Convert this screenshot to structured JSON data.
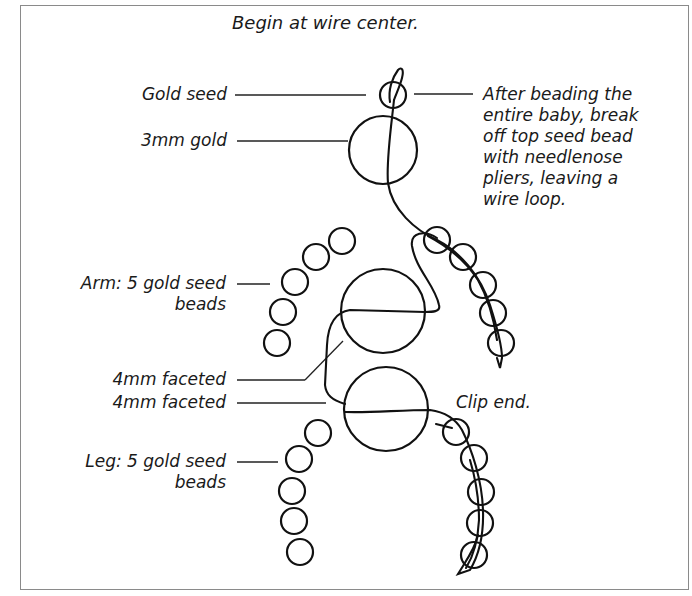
{
  "title": "Begin at wire center.",
  "colors": {
    "stroke": "#111111",
    "frame": "#8a8a8a",
    "leader": "#222222",
    "text": "#1a1a1a"
  },
  "labels": {
    "gold_seed": "Gold seed",
    "gold_3mm": "3mm gold",
    "arm_line1": "Arm: 5 gold seed",
    "arm_line2": "beads",
    "faceted_1": "4mm faceted",
    "faceted_2": "4mm faceted",
    "leg_line1": "Leg: 5 gold seed",
    "leg_line2": "beads",
    "clip_end": "Clip end.",
    "note_lines": [
      "After beading the",
      "entire baby, break",
      "off top seed bead",
      "with needlenose",
      "pliers, leaving a",
      "wire loop."
    ]
  },
  "beads": {
    "top_seed": {
      "cx": 393,
      "cy": 95,
      "r": 13
    },
    "head": {
      "cx": 383,
      "cy": 150,
      "r": 34
    },
    "body_upper": {
      "cx": 383,
      "cy": 311,
      "r": 42
    },
    "body_lower": {
      "cx": 386,
      "cy": 409,
      "r": 42
    },
    "left_arm": [
      {
        "cx": 342,
        "cy": 241,
        "r": 13
      },
      {
        "cx": 316,
        "cy": 257,
        "r": 13
      },
      {
        "cx": 295,
        "cy": 282,
        "r": 13
      },
      {
        "cx": 283,
        "cy": 312,
        "r": 13
      },
      {
        "cx": 277,
        "cy": 343,
        "r": 13
      }
    ],
    "right_arm": [
      {
        "cx": 437,
        "cy": 240,
        "r": 13
      },
      {
        "cx": 463,
        "cy": 257,
        "r": 13
      },
      {
        "cx": 483,
        "cy": 285,
        "r": 13
      },
      {
        "cx": 493,
        "cy": 313,
        "r": 13
      },
      {
        "cx": 501,
        "cy": 343,
        "r": 13
      }
    ],
    "left_leg": [
      {
        "cx": 318,
        "cy": 433,
        "r": 13
      },
      {
        "cx": 299,
        "cy": 459,
        "r": 13
      },
      {
        "cx": 292,
        "cy": 491,
        "r": 13
      },
      {
        "cx": 294,
        "cy": 521,
        "r": 13
      },
      {
        "cx": 300,
        "cy": 552,
        "r": 13
      }
    ],
    "right_leg": [
      {
        "cx": 456,
        "cy": 432,
        "r": 13
      },
      {
        "cx": 474,
        "cy": 458,
        "r": 13
      },
      {
        "cx": 481,
        "cy": 492,
        "r": 13
      },
      {
        "cx": 480,
        "cy": 523,
        "r": 13
      },
      {
        "cx": 474,
        "cy": 555,
        "r": 13
      }
    ]
  }
}
